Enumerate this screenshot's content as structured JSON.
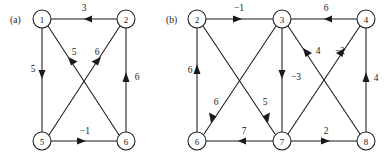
{
  "figure": {
    "background": "#ffffff",
    "ink": "#1a1a1a",
    "panels": [
      {
        "id": "a",
        "caption": "(a)",
        "caption_pos": {
          "x": 10,
          "y": 22
        },
        "nodes": [
          {
            "id": "1",
            "label": "1",
            "x": 42,
            "y": 19,
            "r": 9
          },
          {
            "id": "2",
            "label": "2",
            "x": 126,
            "y": 19,
            "r": 9
          },
          {
            "id": "5",
            "label": "5",
            "x": 42,
            "y": 141,
            "r": 9
          },
          {
            "id": "6",
            "label": "6",
            "x": 126,
            "y": 141,
            "r": 9
          }
        ],
        "edges": [
          {
            "from": "2",
            "to": "1",
            "weight": "3",
            "label_x": 84,
            "label_y": 11
          },
          {
            "from": "1",
            "to": "5",
            "weight": "5",
            "label_x": 33,
            "label_y": 72
          },
          {
            "from": "6",
            "to": "1",
            "weight": "5",
            "label_x": 74,
            "label_y": 55
          },
          {
            "from": "5",
            "to": "2",
            "weight": "6",
            "label_x": 97,
            "label_y": 55
          },
          {
            "from": "6",
            "to": "2",
            "weight": "6",
            "label_x": 136,
            "label_y": 80
          },
          {
            "from": "5",
            "to": "6",
            "weight": "−1",
            "label_x": 84,
            "label_y": 133
          }
        ]
      },
      {
        "id": "b",
        "caption": "(b)",
        "caption_pos": {
          "x": 167,
          "y": 22
        },
        "nodes": [
          {
            "id": "2",
            "label": "2",
            "x": 197,
            "y": 19,
            "r": 9
          },
          {
            "id": "3",
            "label": "3",
            "x": 282,
            "y": 19,
            "r": 9
          },
          {
            "id": "4",
            "label": "4",
            "x": 366,
            "y": 19,
            "r": 9
          },
          {
            "id": "6",
            "label": "6",
            "x": 197,
            "y": 141,
            "r": 9
          },
          {
            "id": "7",
            "label": "7",
            "x": 282,
            "y": 141,
            "r": 9
          },
          {
            "id": "8",
            "label": "8",
            "x": 366,
            "y": 141,
            "r": 9
          }
        ],
        "edges": [
          {
            "from": "2",
            "to": "3",
            "weight": "−1",
            "label_x": 239,
            "label_y": 11
          },
          {
            "from": "4",
            "to": "3",
            "weight": "6",
            "label_x": 326,
            "label_y": 11
          },
          {
            "from": "6",
            "to": "2",
            "weight": "6",
            "label_x": 190,
            "label_y": 72
          },
          {
            "from": "3",
            "to": "7",
            "weight": "−3",
            "label_x": 296,
            "label_y": 80
          },
          {
            "from": "8",
            "to": "4",
            "weight": "4",
            "label_x": 375,
            "label_y": 80
          },
          {
            "from": "3",
            "to": "6",
            "weight": "6",
            "label_x": 216,
            "label_y": 104
          },
          {
            "from": "2",
            "to": "7",
            "weight": "5",
            "label_x": 265,
            "label_y": 104
          },
          {
            "from": "8",
            "to": "3",
            "weight": "4",
            "label_x": 318,
            "label_y": 54
          },
          {
            "from": "7",
            "to": "4",
            "weight": "−2",
            "label_x": 339,
            "label_y": 54
          },
          {
            "from": "7",
            "to": "6",
            "weight": "7",
            "label_x": 244,
            "label_y": 133
          },
          {
            "from": "7",
            "to": "8",
            "weight": "2",
            "label_x": 326,
            "label_y": 133
          }
        ]
      }
    ]
  }
}
